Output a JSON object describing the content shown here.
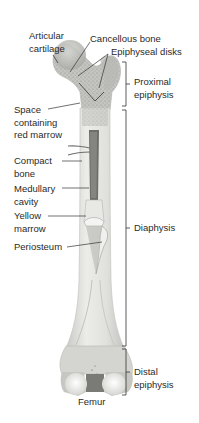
{
  "diagram": {
    "title": "Femur",
    "colors": {
      "bone": "#e2e2de",
      "bone_shade": "#c8c8c4",
      "spongy": "#b9b9b5",
      "marrow_red": "#6d6d6a",
      "line": "#333333",
      "background": "#ffffff"
    },
    "left_labels": [
      {
        "id": "articular-cartilage",
        "lines": [
          "Articular",
          "cartilage"
        ]
      },
      {
        "id": "space-red-marrow",
        "lines": [
          "Space",
          "containing",
          "red marrow"
        ]
      },
      {
        "id": "compact-bone",
        "lines": [
          "Compact",
          "bone"
        ]
      },
      {
        "id": "medullary-cavity",
        "lines": [
          "Medullary",
          "cavity"
        ]
      },
      {
        "id": "yellow-marrow",
        "lines": [
          "Yellow",
          "marrow"
        ]
      },
      {
        "id": "periosteum",
        "lines": [
          "Periosteum"
        ]
      }
    ],
    "top_labels": [
      {
        "id": "cancellous-bone",
        "text": "Cancellous bone"
      },
      {
        "id": "epiphyseal-disks",
        "text": "Epiphyseal disks"
      }
    ],
    "regions": [
      {
        "id": "proximal-epiphysis",
        "lines": [
          "Proximal",
          "epiphysis"
        ],
        "y_start": 62,
        "y_end": 106
      },
      {
        "id": "diaphysis",
        "lines": [
          "Diaphysis"
        ],
        "y_start": 110,
        "y_end": 346
      },
      {
        "id": "distal-epiphysis",
        "lines": [
          "Distal",
          "epiphysis"
        ],
        "y_start": 349,
        "y_end": 395
      }
    ]
  }
}
